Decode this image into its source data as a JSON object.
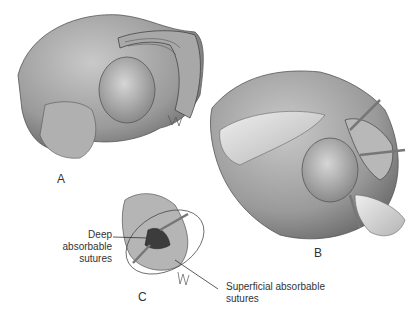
{
  "figure": {
    "panels": [
      {
        "id": "A",
        "label": "A"
      },
      {
        "id": "B",
        "label": "B"
      },
      {
        "id": "C",
        "label": "C"
      }
    ],
    "annotations": {
      "deep": {
        "line1": "Deep absorbable",
        "line2": "sutures"
      },
      "superficial": {
        "line1": "Superficial absorbable",
        "line2": "sutures"
      }
    }
  }
}
